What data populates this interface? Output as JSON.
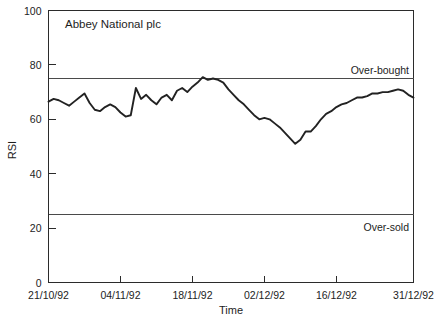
{
  "chart_data": {
    "type": "line",
    "title": "Abbey National plc",
    "xlabel": "Time",
    "ylabel": "RSI",
    "ylim": [
      0,
      100
    ],
    "yticks": [
      0,
      20,
      40,
      60,
      80,
      100
    ],
    "ytick_labels": [
      "0",
      "20",
      "40",
      "60",
      "80",
      "100"
    ],
    "xtick_labels": [
      "21/10/92",
      "04/11/92",
      "18/11/92",
      "02/12/92",
      "16/12/92",
      "31/12/92"
    ],
    "xtick_positions": [
      0,
      14,
      28,
      42,
      56,
      71
    ],
    "xlim": [
      0,
      71
    ],
    "grid": false,
    "legend": null,
    "annotations": [
      {
        "name": "over-bought",
        "label": "Over-bought",
        "value": 75
      },
      {
        "name": "over-sold",
        "label": "Over-sold",
        "value": 25
      }
    ],
    "series": [
      {
        "name": "RSI",
        "color": "#222222",
        "x": [
          0,
          1,
          2,
          3,
          4,
          5,
          6,
          7,
          8,
          9,
          10,
          11,
          12,
          13,
          14,
          15,
          16,
          17,
          18,
          19,
          20,
          21,
          22,
          23,
          24,
          25,
          26,
          27,
          28,
          29,
          30,
          31,
          32,
          33,
          34,
          35,
          36,
          37,
          38,
          39,
          40,
          41,
          42,
          43,
          44,
          45,
          46,
          47,
          48,
          49,
          50,
          51,
          52,
          53,
          54,
          55,
          56,
          57,
          58,
          59,
          60,
          61,
          62,
          63,
          64,
          65,
          66,
          67,
          68,
          69,
          70,
          71
        ],
        "values": [
          66.5,
          67.5,
          67.0,
          66.0,
          65.0,
          66.5,
          68.0,
          69.5,
          66.0,
          63.5,
          63.0,
          64.5,
          65.5,
          64.5,
          62.5,
          61.0,
          61.5,
          71.5,
          67.5,
          69.0,
          67.0,
          65.5,
          68.0,
          69.0,
          67.0,
          70.5,
          71.5,
          70.0,
          72.0,
          73.5,
          75.5,
          74.5,
          75.0,
          74.5,
          73.5,
          71.0,
          69.0,
          67.0,
          65.5,
          63.5,
          61.5,
          60.0,
          60.5,
          60.0,
          58.5,
          57.0,
          55.0,
          53.0,
          51.0,
          52.5,
          55.5,
          55.5,
          57.5,
          60.0,
          62.0,
          63.0,
          64.5,
          65.5,
          66.0,
          67.0,
          68.0,
          68.0,
          68.5,
          69.5,
          69.5,
          70.0,
          70.0,
          70.5,
          71.0,
          70.5,
          69.0,
          68.0
        ]
      }
    ]
  }
}
